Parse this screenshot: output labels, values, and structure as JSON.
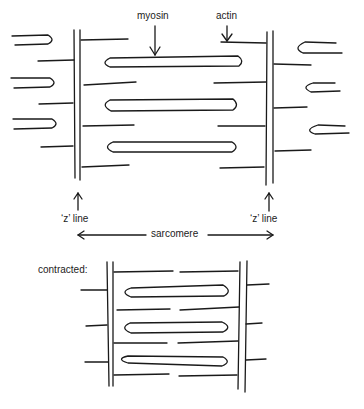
{
  "figure": {
    "relaxed": {
      "labels": {
        "myosin": "myosin",
        "actin": "actin",
        "z_line_left": "‘z’ line",
        "z_line_right": "‘z’ line",
        "sarcomere": "sarcomere"
      }
    },
    "contracted": {
      "label": "contracted:"
    }
  },
  "colors": {
    "ink": "#1a1a1a",
    "background": "#ffffff"
  }
}
